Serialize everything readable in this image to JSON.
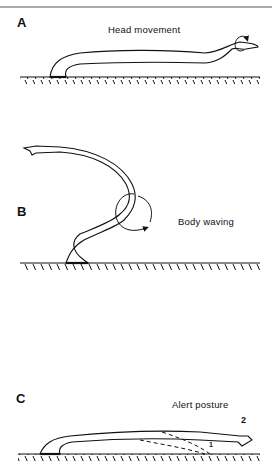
{
  "figure": {
    "panels": [
      {
        "letter": "A",
        "caption": "Head movement"
      },
      {
        "letter": "B",
        "caption": "Body waving"
      },
      {
        "letter": "C",
        "caption": "Alert posture",
        "position_labels": [
          "1",
          "2"
        ]
      }
    ],
    "colors": {
      "ink": "#111111",
      "background": "#ffffff",
      "rule": "#555555"
    }
  }
}
